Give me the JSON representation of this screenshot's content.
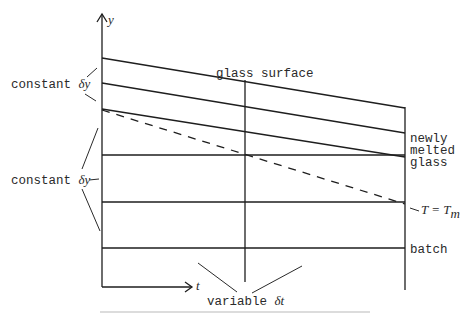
{
  "figure": {
    "axes": {
      "y_label": "y",
      "x_label": "t"
    },
    "labels": {
      "glass_surface": "glass surface",
      "constant_dy_top_text": "constant ",
      "constant_dy_top_sym": "δy",
      "constant_dy_bottom_text": "constant ",
      "constant_dy_bottom_sym": "δy",
      "newly_melted_line1": "newly",
      "newly_melted_line2": "melted",
      "newly_melted_line3": "glass",
      "melting_temp": "T = T",
      "melting_temp_sub": "m",
      "batch": "batch",
      "variable_dt_text": "variable ",
      "variable_dt_sym": "δt"
    },
    "colors": {
      "line": "#1e1e1e",
      "text": "#2a2a2a",
      "background": "#ffffff"
    }
  }
}
